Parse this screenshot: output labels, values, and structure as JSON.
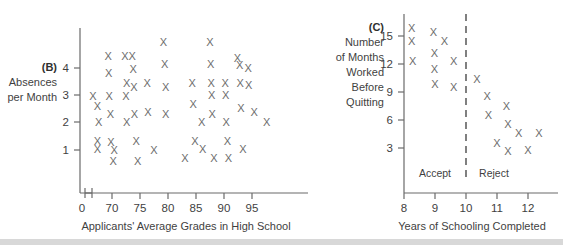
{
  "figure": {
    "background_color": "#ffffff",
    "mark_color": "#6d6d6d",
    "axis_color": "#6a6a6a",
    "mark_glyph": "X"
  },
  "panels": [
    {
      "tag": "(B)",
      "side_label_lines": [
        "Absences",
        "per Month"
      ],
      "xlabel": "Applicants' Average Grades in High School",
      "ylabel": "",
      "x_ticks": [
        70,
        75,
        80,
        85,
        90,
        95
      ],
      "x_origin_tick": "0",
      "y_ticks": [
        1,
        2,
        3,
        4
      ],
      "axis_break": true,
      "chart_data": {
        "type": "scatter",
        "title": "(B) Absences per Month vs Applicants' Average Grades in High School",
        "xlabel": "Applicants' Average Grades in High School",
        "ylabel": "Absences per Month",
        "xlim": [
          66,
          99.5
        ],
        "ylim": [
          0.2,
          5.2
        ],
        "xticks": [
          70,
          75,
          80,
          85,
          90,
          95
        ],
        "yticks": [
          1,
          2,
          3,
          4
        ],
        "grid": false,
        "legend": "none",
        "points": [
          {
            "x": 66.6,
            "y": 2.95
          },
          {
            "x": 67.4,
            "y": 2.6
          },
          {
            "x": 67.6,
            "y": 2.0
          },
          {
            "x": 67.4,
            "y": 1.3
          },
          {
            "x": 67.4,
            "y": 1.0
          },
          {
            "x": 69.3,
            "y": 4.45
          },
          {
            "x": 69.4,
            "y": 3.8
          },
          {
            "x": 69.5,
            "y": 2.95
          },
          {
            "x": 69.7,
            "y": 2.3
          },
          {
            "x": 69.8,
            "y": 1.25
          },
          {
            "x": 70.2,
            "y": 0.55
          },
          {
            "x": 70.4,
            "y": 0.95
          },
          {
            "x": 72.3,
            "y": 4.45
          },
          {
            "x": 72.6,
            "y": 3.45
          },
          {
            "x": 72.5,
            "y": 2.95
          },
          {
            "x": 72.6,
            "y": 2.0
          },
          {
            "x": 73.6,
            "y": 4.45
          },
          {
            "x": 73.8,
            "y": 3.95
          },
          {
            "x": 73.9,
            "y": 3.3
          },
          {
            "x": 74.0,
            "y": 2.3
          },
          {
            "x": 74.3,
            "y": 1.3
          },
          {
            "x": 74.6,
            "y": 0.55
          },
          {
            "x": 76.3,
            "y": 3.45
          },
          {
            "x": 76.4,
            "y": 2.35
          },
          {
            "x": 77.5,
            "y": 0.95
          },
          {
            "x": 79.2,
            "y": 4.95
          },
          {
            "x": 79.4,
            "y": 4.15
          },
          {
            "x": 79.6,
            "y": 3.3
          },
          {
            "x": 79.6,
            "y": 2.3
          },
          {
            "x": 83.0,
            "y": 0.65
          },
          {
            "x": 84.3,
            "y": 3.45
          },
          {
            "x": 84.5,
            "y": 2.65
          },
          {
            "x": 84.8,
            "y": 1.3
          },
          {
            "x": 86.0,
            "y": 2.0
          },
          {
            "x": 86.2,
            "y": 1.0
          },
          {
            "x": 87.5,
            "y": 4.95
          },
          {
            "x": 87.6,
            "y": 4.15
          },
          {
            "x": 87.7,
            "y": 3.45
          },
          {
            "x": 87.8,
            "y": 3.0
          },
          {
            "x": 87.9,
            "y": 2.3
          },
          {
            "x": 88.2,
            "y": 0.65
          },
          {
            "x": 90.2,
            "y": 3.45
          },
          {
            "x": 90.3,
            "y": 3.0
          },
          {
            "x": 90.4,
            "y": 2.0
          },
          {
            "x": 90.6,
            "y": 1.3
          },
          {
            "x": 90.8,
            "y": 0.65
          },
          {
            "x": 92.4,
            "y": 4.35
          },
          {
            "x": 92.8,
            "y": 4.1
          },
          {
            "x": 92.9,
            "y": 3.45
          },
          {
            "x": 93.0,
            "y": 2.5
          },
          {
            "x": 93.4,
            "y": 1.0
          },
          {
            "x": 94.3,
            "y": 4.0
          },
          {
            "x": 94.4,
            "y": 3.35
          },
          {
            "x": 95.4,
            "y": 2.35
          },
          {
            "x": 97.6,
            "y": 2.0
          }
        ]
      }
    },
    {
      "tag": "(C)",
      "side_label_lines": [
        "Number",
        "of Months",
        "Worked",
        "Before",
        "Quitting"
      ],
      "xlabel": "Years of Schooling Completed",
      "ylabel": "",
      "x_ticks": [
        8,
        9,
        10,
        11,
        12
      ],
      "y_ticks": [
        3,
        6,
        9,
        12,
        15
      ],
      "divider_x": 10,
      "region_labels": [
        {
          "text": "Accept",
          "x": 9.0
        },
        {
          "text": "Reject",
          "x": 10.75
        }
      ],
      "chart_data": {
        "type": "scatter",
        "title": "(C) Number of Months Worked Before Quitting vs Years of Schooling Completed",
        "xlabel": "Years of Schooling Completed",
        "ylabel": "Number of Months Worked Before Quitting",
        "xlim": [
          7.7,
          12.8
        ],
        "ylim": [
          1.0,
          17.0
        ],
        "xticks": [
          8,
          9,
          10,
          11,
          12
        ],
        "yticks": [
          3,
          6,
          9,
          12,
          15
        ],
        "grid": false,
        "legend": "none",
        "annotations": [
          {
            "type": "vline",
            "x": 10,
            "style": "dashed"
          },
          {
            "type": "text",
            "text": "Accept",
            "x": 9.0,
            "y": 1.9
          },
          {
            "type": "text",
            "text": "Reject",
            "x": 10.75,
            "y": 1.9
          }
        ],
        "points": [
          {
            "x": 8.25,
            "y": 15.7
          },
          {
            "x": 8.25,
            "y": 14.3
          },
          {
            "x": 8.28,
            "y": 12.2
          },
          {
            "x": 8.95,
            "y": 15.3
          },
          {
            "x": 8.98,
            "y": 13.1
          },
          {
            "x": 8.98,
            "y": 11.3
          },
          {
            "x": 9.0,
            "y": 9.7
          },
          {
            "x": 9.3,
            "y": 14.3
          },
          {
            "x": 9.6,
            "y": 12.2
          },
          {
            "x": 9.6,
            "y": 9.4
          },
          {
            "x": 10.35,
            "y": 10.3
          },
          {
            "x": 10.68,
            "y": 8.5
          },
          {
            "x": 10.72,
            "y": 6.4
          },
          {
            "x": 11.0,
            "y": 3.4
          },
          {
            "x": 11.3,
            "y": 7.4
          },
          {
            "x": 11.35,
            "y": 5.5
          },
          {
            "x": 11.35,
            "y": 2.6
          },
          {
            "x": 11.7,
            "y": 4.5
          },
          {
            "x": 12.0,
            "y": 2.7
          },
          {
            "x": 12.35,
            "y": 4.5
          }
        ]
      }
    }
  ]
}
